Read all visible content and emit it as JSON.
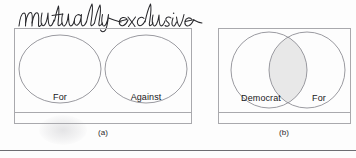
{
  "figure": {
    "annotation": "mutually exclusive",
    "annotation_style": "handwritten-cursive",
    "annotation_color": "#28282c",
    "background_color": "#fdfdfd",
    "outline_color": "#8f8f95",
    "panel_border_color": "#a9a9ad",
    "overlap_fill_color": "#e8e8e8",
    "bottom_rule_color": "#6d6d72"
  },
  "panels": [
    {
      "id": "a",
      "caption": "(a)",
      "kind": "disjoint-venn",
      "sets": [
        {
          "label": "For"
        },
        {
          "label": "Against"
        }
      ],
      "overlap": false
    },
    {
      "id": "b",
      "caption": "(b)",
      "kind": "overlapping-venn",
      "sets": [
        {
          "label": "Democrat"
        },
        {
          "label": "For"
        }
      ],
      "overlap": true
    }
  ]
}
